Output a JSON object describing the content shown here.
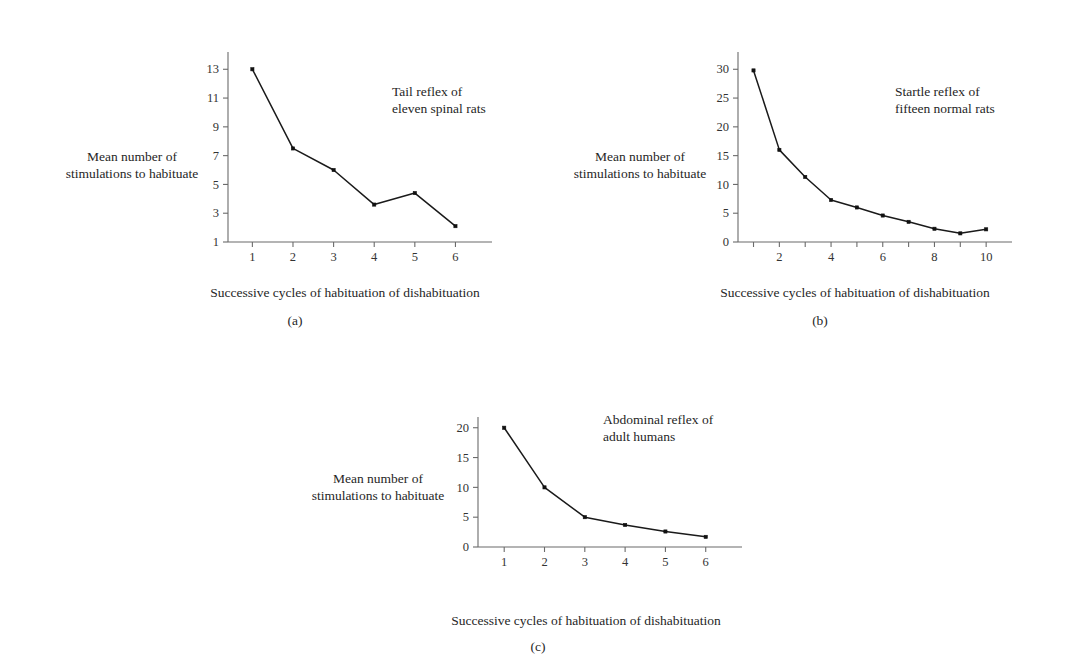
{
  "figure": {
    "background_color": "#ffffff",
    "line_color": "#1a1a1a",
    "axis_color": "#6b6b6b",
    "text_color": "#262626"
  },
  "panels": [
    {
      "caption": "(a)",
      "title": "Tail reflex of\neleven spinal rats",
      "y_axis_caption": "Mean number of\nstimulations to habituate",
      "x_axis_caption": "Successive cycles of habituation of dishabituation"
    },
    {
      "caption": "(b)",
      "title": "Startle reflex of\nfifteen normal rats",
      "y_axis_caption": "Mean number of\nstimulations to habituate",
      "x_axis_caption": "Successive cycles of habituation of dishabituation"
    },
    {
      "caption": "(c)",
      "title": "Abdominal reflex of\nadult humans",
      "y_axis_caption": "Mean number of\nstimulations to habituate",
      "x_axis_caption": "Successive cycles of habituation of dishabituation"
    }
  ],
  "chart_data": [
    {
      "type": "line",
      "title": "Tail reflex of eleven spinal rats",
      "panel": "(a)",
      "xlabel": "Successive cycles of habituation of dishabituation",
      "ylabel": "Mean number of stimulations to habituate",
      "x": [
        1,
        2,
        3,
        4,
        5,
        6
      ],
      "values": [
        13,
        7.5,
        6,
        3.6,
        4.4,
        2.1
      ],
      "xticks": [
        1,
        2,
        3,
        4,
        5,
        6
      ],
      "xtick_labels": [
        "1",
        "2",
        "3",
        "4",
        "5",
        "6"
      ],
      "yticks": [
        1,
        3,
        5,
        7,
        9,
        11,
        13
      ],
      "ytick_labels": [
        "1",
        "3",
        "5",
        "7",
        "9",
        "11",
        "13"
      ],
      "xlim": [
        0.4,
        6.9
      ],
      "ylim": [
        1,
        14.2
      ],
      "grid": false,
      "legend": "none",
      "markers": "filled-square"
    },
    {
      "type": "line",
      "title": "Startle reflex of fifteen normal rats",
      "panel": "(b)",
      "xlabel": "Successive cycles of habituation of dishabituation",
      "ylabel": "Mean number of stimulations to habituate",
      "x": [
        1,
        2,
        3,
        4,
        5,
        6,
        7,
        8,
        9,
        10
      ],
      "values": [
        29.8,
        16.0,
        11.3,
        7.3,
        6.0,
        4.6,
        3.5,
        2.3,
        1.5,
        2.2
      ],
      "xticks": [
        1,
        2,
        3,
        4,
        5,
        6,
        7,
        8,
        9,
        10
      ],
      "xtick_labels": [
        "",
        "2",
        "",
        "4",
        "",
        "6",
        "",
        "8",
        "",
        "10"
      ],
      "yticks": [
        0,
        5,
        10,
        15,
        20,
        25,
        30
      ],
      "ytick_labels": [
        "0",
        "5",
        "10",
        "15",
        "20",
        "25",
        "30"
      ],
      "xlim": [
        0.4,
        11.0
      ],
      "ylim": [
        0,
        33
      ],
      "grid": false,
      "legend": "none",
      "markers": "filled-square"
    },
    {
      "type": "line",
      "title": "Abdominal reflex of adult humans",
      "panel": "(c)",
      "xlabel": "Successive cycles of habituation of dishabituation",
      "ylabel": "Mean number of stimulations to habituate",
      "x": [
        1,
        2,
        3,
        4,
        5,
        6
      ],
      "values": [
        20,
        10,
        5,
        3.7,
        2.6,
        1.7
      ],
      "xticks": [
        1,
        2,
        3,
        4,
        5,
        6
      ],
      "xtick_labels": [
        "1",
        "2",
        "3",
        "4",
        "5",
        "6"
      ],
      "yticks": [
        0,
        5,
        10,
        15,
        20
      ],
      "ytick_labels": [
        "0",
        "5",
        "10",
        "15",
        "20"
      ],
      "xlim": [
        0.35,
        6.9
      ],
      "ylim": [
        0,
        21.8
      ],
      "grid": false,
      "legend": "none",
      "markers": "filled-square"
    }
  ]
}
